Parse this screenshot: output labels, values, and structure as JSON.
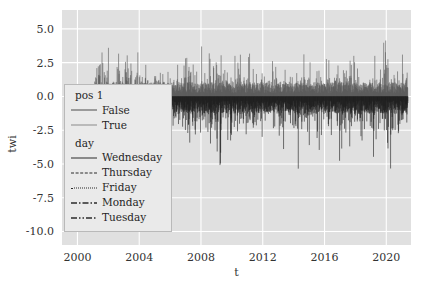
{
  "chart_data": {
    "type": "line",
    "title": "",
    "xlabel": "t",
    "ylabel": "twi",
    "xlim": [
      1999.0,
      2021.6
    ],
    "ylim": [
      -11.0,
      6.4
    ],
    "xticks": [
      "2000",
      "2004",
      "2008",
      "2012",
      "2016",
      "2020"
    ],
    "xtick_values": [
      2000,
      2004,
      2008,
      2012,
      2016,
      2020
    ],
    "yticks": [
      "5.0",
      "2.5",
      "0.0",
      "-2.5",
      "-5.0",
      "-7.5",
      "-10.0"
    ],
    "ytick_values": [
      5.0,
      2.5,
      0.0,
      -2.5,
      -5.0,
      -7.5,
      -10.0
    ],
    "grid": true,
    "grid_color": "#ffffff",
    "axes_facecolor": "#e0e0e0",
    "legend_position": "center left",
    "series": [
      {
        "name": "False",
        "group": "pos 1",
        "color": "#595959",
        "linestyle": "solid",
        "x_range": [
          2001.0,
          2021.4
        ],
        "y_range": [
          0.0,
          6.2
        ],
        "description": "positive spike envelope above zero"
      },
      {
        "name": "True",
        "group": "pos 1",
        "color": "#6e6e6e",
        "linestyle": "solid",
        "x_range": [
          2005.9,
          2021.4
        ],
        "y_range": [
          -10.3,
          0.0
        ],
        "description": "negative spike envelope below zero"
      }
    ],
    "annotations": [],
    "envelope_positive": [
      {
        "t": 2001.0,
        "y": 2.4
      },
      {
        "t": 2001.2,
        "y": 4.4
      },
      {
        "t": 2001.4,
        "y": 5.6
      },
      {
        "t": 2001.6,
        "y": 4.6
      },
      {
        "t": 2001.8,
        "y": 5.2
      },
      {
        "t": 2002.0,
        "y": 3.9
      },
      {
        "t": 2002.2,
        "y": 5.9
      },
      {
        "t": 2002.4,
        "y": 4.3
      },
      {
        "t": 2002.6,
        "y": 3.4
      },
      {
        "t": 2002.8,
        "y": 5.1
      },
      {
        "t": 2003.0,
        "y": 3.8
      },
      {
        "t": 2003.2,
        "y": 4.8
      },
      {
        "t": 2003.4,
        "y": 3.2
      },
      {
        "t": 2003.6,
        "y": 5.6
      },
      {
        "t": 2003.8,
        "y": 3.9
      },
      {
        "t": 2004.0,
        "y": 3.1
      },
      {
        "t": 2004.3,
        "y": 4.4
      },
      {
        "t": 2004.6,
        "y": 2.9
      },
      {
        "t": 2004.9,
        "y": 2.6
      },
      {
        "t": 2005.2,
        "y": 2.4
      },
      {
        "t": 2005.5,
        "y": 2.2
      },
      {
        "t": 2005.8,
        "y": 2.5
      },
      {
        "t": 2006.1,
        "y": 2.3
      },
      {
        "t": 2006.4,
        "y": 3.3
      },
      {
        "t": 2006.7,
        "y": 2.7
      },
      {
        "t": 2007.0,
        "y": 3.6
      },
      {
        "t": 2007.3,
        "y": 4.2
      },
      {
        "t": 2007.6,
        "y": 3.0
      },
      {
        "t": 2007.9,
        "y": 3.5
      },
      {
        "t": 2008.2,
        "y": 5.4
      },
      {
        "t": 2008.5,
        "y": 4.1
      },
      {
        "t": 2008.8,
        "y": 5.8
      },
      {
        "t": 2009.1,
        "y": 4.0
      },
      {
        "t": 2009.4,
        "y": 3.0
      },
      {
        "t": 2009.7,
        "y": 2.6
      },
      {
        "t": 2010.0,
        "y": 3.2
      },
      {
        "t": 2010.4,
        "y": 4.6
      },
      {
        "t": 2010.8,
        "y": 2.8
      },
      {
        "t": 2011.2,
        "y": 3.4
      },
      {
        "t": 2011.6,
        "y": 2.5
      },
      {
        "t": 2012.0,
        "y": 3.8
      },
      {
        "t": 2012.4,
        "y": 2.7
      },
      {
        "t": 2012.8,
        "y": 2.9
      },
      {
        "t": 2013.2,
        "y": 3.1
      },
      {
        "t": 2013.6,
        "y": 2.6
      },
      {
        "t": 2014.0,
        "y": 3.9
      },
      {
        "t": 2014.4,
        "y": 2.8
      },
      {
        "t": 2014.8,
        "y": 3.3
      },
      {
        "t": 2015.2,
        "y": 2.5
      },
      {
        "t": 2015.6,
        "y": 3.0
      },
      {
        "t": 2016.0,
        "y": 3.6
      },
      {
        "t": 2016.4,
        "y": 2.7
      },
      {
        "t": 2016.8,
        "y": 3.2
      },
      {
        "t": 2017.2,
        "y": 2.6
      },
      {
        "t": 2017.6,
        "y": 3.4
      },
      {
        "t": 2018.0,
        "y": 2.9
      },
      {
        "t": 2018.4,
        "y": 3.1
      },
      {
        "t": 2018.8,
        "y": 2.7
      },
      {
        "t": 2019.2,
        "y": 3.5
      },
      {
        "t": 2019.6,
        "y": 2.8
      },
      {
        "t": 2020.0,
        "y": 5.3
      },
      {
        "t": 2020.4,
        "y": 3.2
      },
      {
        "t": 2020.8,
        "y": 4.7
      },
      {
        "t": 2021.2,
        "y": 3.0
      }
    ],
    "envelope_negative": [
      {
        "t": 2005.9,
        "y": -1.4
      },
      {
        "t": 2006.2,
        "y": -3.6
      },
      {
        "t": 2006.5,
        "y": -5.1
      },
      {
        "t": 2006.8,
        "y": -3.0
      },
      {
        "t": 2007.1,
        "y": -6.2
      },
      {
        "t": 2007.4,
        "y": -4.1
      },
      {
        "t": 2007.7,
        "y": -7.3
      },
      {
        "t": 2008.0,
        "y": -4.6
      },
      {
        "t": 2008.3,
        "y": -3.2
      },
      {
        "t": 2008.6,
        "y": -5.4
      },
      {
        "t": 2008.9,
        "y": -3.8
      },
      {
        "t": 2009.2,
        "y": -6.0
      },
      {
        "t": 2009.5,
        "y": -4.2
      },
      {
        "t": 2009.8,
        "y": -3.1
      },
      {
        "t": 2010.1,
        "y": -5.2
      },
      {
        "t": 2010.4,
        "y": -3.5
      },
      {
        "t": 2010.7,
        "y": -4.4
      },
      {
        "t": 2011.0,
        "y": -2.9
      },
      {
        "t": 2011.3,
        "y": -5.6
      },
      {
        "t": 2011.6,
        "y": -3.3
      },
      {
        "t": 2011.9,
        "y": -4.0
      },
      {
        "t": 2012.2,
        "y": -2.8
      },
      {
        "t": 2012.5,
        "y": -3.6
      },
      {
        "t": 2012.8,
        "y": -5.0
      },
      {
        "t": 2013.1,
        "y": -3.2
      },
      {
        "t": 2013.4,
        "y": -4.3
      },
      {
        "t": 2013.7,
        "y": -2.7
      },
      {
        "t": 2014.0,
        "y": -3.9
      },
      {
        "t": 2014.3,
        "y": -5.8
      },
      {
        "t": 2014.6,
        "y": -3.4
      },
      {
        "t": 2014.9,
        "y": -4.1
      },
      {
        "t": 2015.2,
        "y": -2.9
      },
      {
        "t": 2015.5,
        "y": -3.7
      },
      {
        "t": 2015.8,
        "y": -4.9
      },
      {
        "t": 2016.1,
        "y": -3.1
      },
      {
        "t": 2016.4,
        "y": -4.5
      },
      {
        "t": 2016.7,
        "y": -2.8
      },
      {
        "t": 2017.0,
        "y": -7.0
      },
      {
        "t": 2017.3,
        "y": -3.5
      },
      {
        "t": 2017.6,
        "y": -4.2
      },
      {
        "t": 2017.9,
        "y": -3.0
      },
      {
        "t": 2018.2,
        "y": -5.3
      },
      {
        "t": 2018.5,
        "y": -3.8
      },
      {
        "t": 2018.8,
        "y": -4.6
      },
      {
        "t": 2019.1,
        "y": -6.5
      },
      {
        "t": 2019.4,
        "y": -3.3
      },
      {
        "t": 2019.7,
        "y": -4.8
      },
      {
        "t": 2020.0,
        "y": -3.6
      },
      {
        "t": 2020.3,
        "y": -7.6
      },
      {
        "t": 2020.6,
        "y": -4.0
      },
      {
        "t": 2020.9,
        "y": -5.5
      },
      {
        "t": 2021.2,
        "y": -3.4
      }
    ]
  },
  "legend": {
    "groups": [
      {
        "title": "pos 1",
        "entries": [
          {
            "label": "False",
            "linestyle": "solid",
            "color": "#4a4a4a"
          },
          {
            "label": "True",
            "linestyle": "solid",
            "color": "#8a8a8a"
          }
        ]
      },
      {
        "title": "day",
        "entries": [
          {
            "label": "Wednesday",
            "linestyle": "solid",
            "color": "#2b2b2b"
          },
          {
            "label": "Thursday",
            "linestyle": "dashed",
            "color": "#2b2b2b"
          },
          {
            "label": "Friday",
            "linestyle": "dotted",
            "color": "#2b2b2b"
          },
          {
            "label": "Monday",
            "linestyle": "dashdot",
            "color": "#2b2b2b"
          },
          {
            "label": "Tuesday",
            "linestyle": "dashdotdot",
            "color": "#2b2b2b"
          }
        ]
      }
    ]
  }
}
